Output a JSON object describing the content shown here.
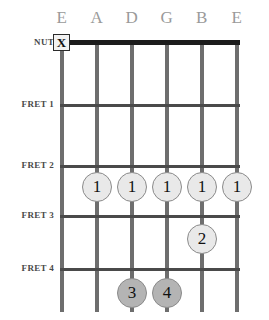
{
  "diagram": {
    "type": "guitar-chord-diagram",
    "nut_label": "NUT",
    "mute_marker": "X",
    "string_labels": [
      "E",
      "A",
      "D",
      "G",
      "B",
      "E"
    ],
    "fret_labels": [
      "FRET 1",
      "FRET 2",
      "FRET 3",
      "FRET 4"
    ],
    "colors": {
      "nut": "#1c1c1c",
      "fret": "#4a4a4a",
      "string": "#6e6e6e",
      "label": "#9a9a9a",
      "dot_light": "#e9e9e9",
      "dot_dark": "#b4b4b4",
      "background": "#ffffff"
    },
    "muted_strings": [
      {
        "string_label": "E",
        "string_index": 0,
        "marker": "X"
      }
    ],
    "finger_dots": [
      {
        "finger": "1",
        "string_label": "A",
        "string_index": 1,
        "fret": 2,
        "shade": "light"
      },
      {
        "finger": "1",
        "string_label": "D",
        "string_index": 2,
        "fret": 2,
        "shade": "light"
      },
      {
        "finger": "1",
        "string_label": "G",
        "string_index": 3,
        "fret": 2,
        "shade": "light"
      },
      {
        "finger": "1",
        "string_label": "B",
        "string_index": 4,
        "fret": 2,
        "shade": "light"
      },
      {
        "finger": "1",
        "string_label": "E",
        "string_index": 5,
        "fret": 2,
        "shade": "light"
      },
      {
        "finger": "2",
        "string_label": "B",
        "string_index": 4,
        "fret": 3,
        "shade": "light"
      },
      {
        "finger": "3",
        "string_label": "D",
        "string_index": 2,
        "fret": 5,
        "shade": "dark"
      },
      {
        "finger": "4",
        "string_label": "G",
        "string_index": 3,
        "fret": 5,
        "shade": "dark"
      }
    ]
  },
  "geometry": {
    "string_x": [
      62,
      97,
      132,
      167,
      202,
      237
    ],
    "nut_y": 40,
    "fret_y": [
      104,
      165,
      215,
      268
    ],
    "dot_row_y": [
      186,
      236,
      292
    ]
  }
}
